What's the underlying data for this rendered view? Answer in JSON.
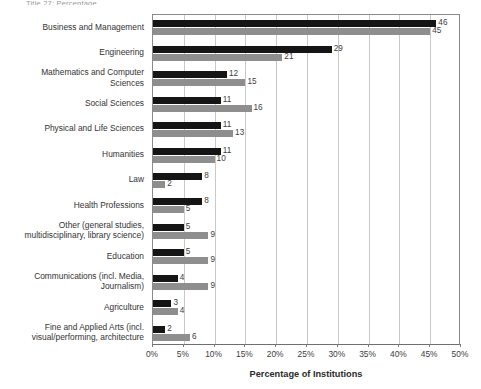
{
  "caption_sliver": "Title 27: Percentage",
  "legend": {
    "position": "inside-right",
    "entries": [
      {
        "label": "EU",
        "color": "#151515",
        "swatch": "square-swatch-icon"
      },
      {
        "label": "U.S.",
        "color": "#8e8e8e",
        "swatch": "square-swatch-icon"
      }
    ]
  },
  "axis": {
    "x_title": "Percentage of Institutions",
    "x_ticks": [
      "0%",
      "5%",
      "10%",
      "15%",
      "20%",
      "25%",
      "30%",
      "35%",
      "40%",
      "45%",
      "50%"
    ]
  },
  "chart_data": {
    "type": "bar",
    "orientation": "horizontal",
    "title": "",
    "subtitle": "",
    "xlabel": "Percentage of Institutions",
    "ylabel": "",
    "xlim": [
      0,
      50
    ],
    "xtick_step": 5,
    "grid": true,
    "legend_position": "inside-right",
    "value_labels": true,
    "categories": [
      "Business and Management",
      "Engineering",
      "Mathematics and Computer Sciences",
      "Social Sciences",
      "Physical and Life Sciences",
      "Humanities",
      "Law",
      "Health Professions",
      "Other (general studies, multidisciplinary, library science)",
      "Education",
      "Communications (incl. Media, Journalism)",
      "Agriculture",
      "Fine and Applied Arts (incl. visual/performing, architecture"
    ],
    "category_lines": [
      [
        "Business and Management"
      ],
      [
        "Engineering"
      ],
      [
        "Mathematics and Computer",
        "Sciences"
      ],
      [
        "Social Sciences"
      ],
      [
        "Physical and Life Sciences"
      ],
      [
        "Humanities"
      ],
      [
        "Law"
      ],
      [
        "Health Professions"
      ],
      [
        "Other (general studies,",
        "multidisciplinary, library science)"
      ],
      [
        "Education"
      ],
      [
        "Communications (incl. Media,",
        "Journalism)"
      ],
      [
        "Agriculture"
      ],
      [
        "Fine and Applied Arts (incl.",
        "visual/performing, architecture"
      ]
    ],
    "series": [
      {
        "name": "EU",
        "color": "#151515",
        "values": [
          46,
          29,
          12,
          11,
          11,
          11,
          8,
          8,
          5,
          5,
          4,
          3,
          2
        ]
      },
      {
        "name": "U.S.",
        "color": "#8e8e8e",
        "values": [
          45,
          21,
          15,
          16,
          13,
          10,
          2,
          5,
          9,
          9,
          9,
          4,
          6
        ]
      }
    ]
  },
  "colors": {
    "eu": "#151515",
    "us": "#8e8e8e",
    "grid": "#c9c9c9",
    "axis": "#8b8b8b",
    "text": "#333333",
    "background": "#ffffff"
  }
}
